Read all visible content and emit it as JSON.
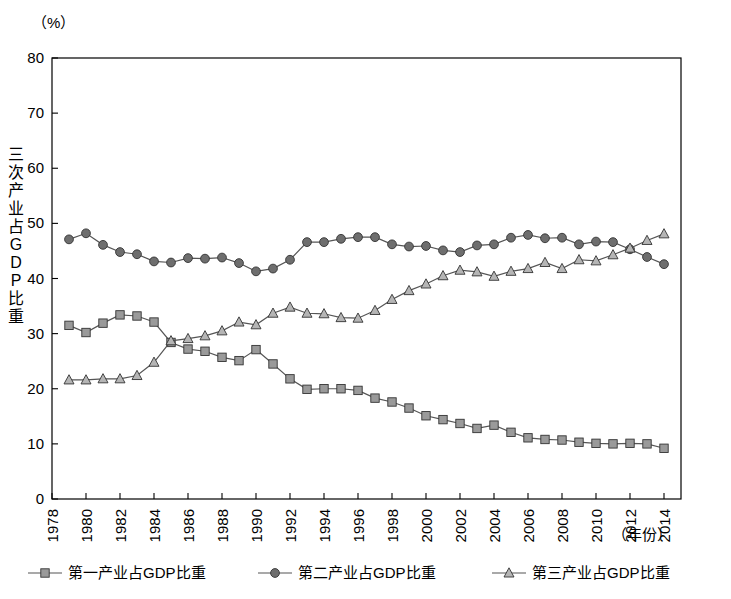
{
  "chart_data": {
    "type": "line",
    "title": "",
    "unit_label": "（%）",
    "xlabel": "（年份）",
    "ylabel": "三次产业占GDP比重",
    "ylim": [
      0,
      80
    ],
    "yticks": [
      0,
      10,
      20,
      30,
      40,
      50,
      60,
      70,
      80
    ],
    "xlim": [
      1978,
      2015
    ],
    "xticks": [
      1978,
      1980,
      1982,
      1984,
      1986,
      1988,
      1990,
      1992,
      1994,
      1996,
      1998,
      2000,
      2002,
      2004,
      2006,
      2008,
      2010,
      2012,
      2014
    ],
    "grid": false,
    "legend_position": "bottom",
    "x": [
      1979,
      1980,
      1981,
      1982,
      1983,
      1984,
      1985,
      1986,
      1987,
      1988,
      1989,
      1990,
      1991,
      1992,
      1993,
      1994,
      1995,
      1996,
      1997,
      1998,
      1999,
      2000,
      2001,
      2002,
      2003,
      2004,
      2005,
      2006,
      2007,
      2008,
      2009,
      2010,
      2011,
      2012,
      2013,
      2014
    ],
    "series": [
      {
        "name": "第一产业占GDP比重",
        "marker": "square",
        "color": "#9a9a9a",
        "values": [
          31.5,
          30.2,
          31.9,
          33.4,
          33.2,
          32.1,
          28.4,
          27.2,
          26.8,
          25.7,
          25.1,
          27.1,
          24.5,
          21.8,
          19.9,
          20.0,
          20.0,
          19.7,
          18.3,
          17.6,
          16.5,
          15.1,
          14.4,
          13.7,
          12.8,
          13.4,
          12.1,
          11.1,
          10.8,
          10.7,
          10.3,
          10.1,
          10.0,
          10.1,
          10.0,
          9.2
        ]
      },
      {
        "name": "第二产业占GDP比重",
        "marker": "circle",
        "color": "#6e6e6e",
        "values": [
          47.1,
          48.2,
          46.1,
          44.8,
          44.4,
          43.1,
          42.9,
          43.7,
          43.6,
          43.8,
          42.8,
          41.3,
          41.8,
          43.4,
          46.6,
          46.6,
          47.2,
          47.5,
          47.5,
          46.2,
          45.8,
          45.9,
          45.1,
          44.8,
          46.0,
          46.2,
          47.4,
          47.9,
          47.3,
          47.4,
          46.2,
          46.7,
          46.6,
          45.3,
          43.9,
          42.6
        ]
      },
      {
        "name": "第三产业占GDP比重",
        "marker": "triangle",
        "color": "#b5b5b5",
        "values": [
          21.6,
          21.6,
          21.8,
          21.8,
          22.4,
          24.8,
          28.7,
          29.1,
          29.6,
          30.5,
          32.1,
          31.6,
          33.7,
          34.8,
          33.7,
          33.6,
          32.9,
          32.8,
          34.2,
          36.2,
          37.8,
          39.0,
          40.5,
          41.5,
          41.2,
          40.4,
          41.3,
          41.8,
          42.9,
          41.8,
          43.4,
          43.2,
          44.3,
          45.5,
          46.9,
          48.1
        ]
      }
    ],
    "legend": [
      {
        "label": "第一产业占GDP比重",
        "marker": "square",
        "color": "#9a9a9a"
      },
      {
        "label": "第二产业占GDP比重",
        "marker": "circle",
        "color": "#6e6e6e"
      },
      {
        "label": "第三产业占GDP比重",
        "marker": "triangle",
        "color": "#b5b5b5"
      }
    ]
  },
  "ylabel_chars": [
    "三",
    "次",
    "产",
    "业",
    "占",
    "G",
    "D",
    "P",
    "比",
    "重"
  ]
}
